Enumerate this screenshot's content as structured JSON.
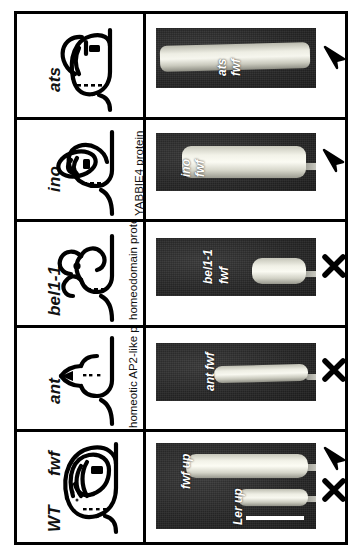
{
  "figure": {
    "type": "multi-panel-micrograph-plate",
    "orientation": "rotated-90-ccw",
    "rows": 5,
    "columns": [
      "schematic diagram",
      "micrograph"
    ],
    "colors": {
      "frame": "#000000",
      "background": "#ffffff",
      "micrograph_background": "#2b2b2b",
      "specimen": "#e8e8dd",
      "label_text": "#ffffff",
      "scalebar": "#ffffff"
    }
  },
  "markers": {
    "elongated_symbol": "arrowhead",
    "not_elongated_symbol": "X"
  },
  "panels": [
    {
      "id": "ats",
      "genotype": "ats",
      "protein": "",
      "schematic": "ats-ovule-diagram",
      "photo_labels": [
        "ats",
        "fwf"
      ],
      "marker": "arrowhead",
      "scalebar": false
    },
    {
      "id": "ino",
      "genotype": "ino",
      "protein": "YABBIE4 protein",
      "schematic": "ino-ovule-diagram",
      "photo_labels": [
        "ino",
        "fwf"
      ],
      "marker": "arrowhead",
      "scalebar": false
    },
    {
      "id": "bel1-1",
      "genotype": "bel1-1",
      "protein": "homeodomain protein",
      "schematic": "bel1-ovule-diagram",
      "photo_labels": [
        "bel1-1",
        "fwf"
      ],
      "marker": "X",
      "scalebar": false
    },
    {
      "id": "ant",
      "genotype": "ant",
      "protein": "homeotic AP2-like protein",
      "schematic": "ant-ovule-diagram",
      "photo_labels": [
        "ant fwf"
      ],
      "marker": "X",
      "scalebar": false
    },
    {
      "id": "wt",
      "genotype": "WT",
      "genotype_secondary": "fwf",
      "protein": "",
      "schematic": "wt-ovule-diagram",
      "photo_labels": [
        "fwf up",
        "Ler up"
      ],
      "marker": "arrowhead",
      "marker_secondary": "X",
      "scalebar": true
    }
  ]
}
